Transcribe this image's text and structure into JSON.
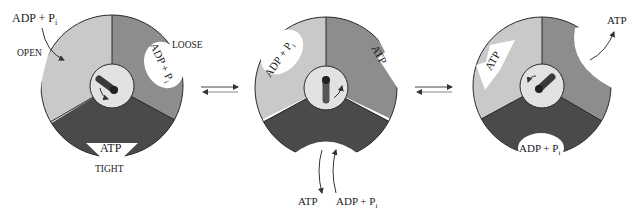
{
  "figure": {
    "colors": {
      "light": "#c9c9c9",
      "medium": "#8d8d8d",
      "dark": "#4a4a4a",
      "hub": "#e2e2e2",
      "shaft": "#3a3a3a",
      "outline": "#2a2a2a"
    }
  },
  "state1": {
    "substrate_in": "ADP + P",
    "substrate_in_sub": "i",
    "open_label": "OPEN",
    "loose_label": "LOOSE",
    "loose_site": "ADP + P",
    "loose_site_sub": "i",
    "tight_site": "ATP",
    "tight_label": "TIGHT"
  },
  "state2": {
    "site_left": "ADP + P",
    "site_left_sub": "i",
    "site_right": "ATP",
    "out_label": "ATP",
    "in_label": "ADP + P",
    "in_label_sub": "i"
  },
  "state3": {
    "site_left": "ATP",
    "released": "ATP",
    "site_bottom": "ADP + P",
    "site_bottom_sub": "i"
  }
}
